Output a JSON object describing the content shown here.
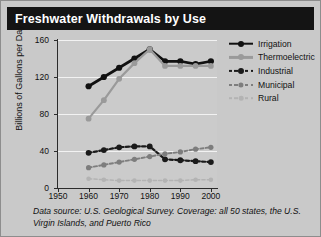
{
  "title": "Freshwater Withdrawals by Use",
  "caption": "Data source: U.S. Geological Survey. Coverage: all 50 states, the U.S. Virgin Islands, and Puerto Rico",
  "colors": {
    "background": "#c9c9c9",
    "title_bar": "#141414",
    "title_text": "#ffffff",
    "axis": "#2b2b2b",
    "gridline": "#f2f2f2",
    "irrigation": "#111111",
    "thermoelectric": "#9a9a9a",
    "industrial": "#1a1a1a",
    "municipal": "#7d7d7d",
    "rural": "#b3b3b3"
  },
  "legend": {
    "position": "right",
    "items": [
      {
        "label": "Irrigation",
        "color": "#111111",
        "dash": "solid",
        "width": 2.6
      },
      {
        "label": "Thermoelectric",
        "color": "#9a9a9a",
        "dash": "solid",
        "width": 2.2
      },
      {
        "label": "Industrial",
        "color": "#1a1a1a",
        "dash": "dashed",
        "width": 2.2
      },
      {
        "label": "Municipal",
        "color": "#7d7d7d",
        "dash": "dashed",
        "width": 2.0
      },
      {
        "label": "Rural",
        "color": "#b3b3b3",
        "dash": "dashed",
        "width": 1.6
      }
    ]
  },
  "chart_data": {
    "type": "line",
    "title": "Freshwater Withdrawals by Use",
    "xlabel": "",
    "ylabel": "Billions of Gallons per Day",
    "xlim": [
      1950,
      2002
    ],
    "ylim": [
      0,
      160
    ],
    "yticks": [
      0,
      40,
      80,
      120,
      160
    ],
    "xticks": [
      1950,
      1960,
      1970,
      1980,
      1990,
      2000
    ],
    "grid": "horizontal",
    "x": [
      1960,
      1965,
      1970,
      1975,
      1980,
      1985,
      1990,
      1995,
      2000
    ],
    "series": [
      {
        "name": "Irrigation",
        "color": "#111111",
        "dash": "solid",
        "values": [
          110,
          120,
          130,
          140,
          150,
          137,
          137,
          134,
          137
        ]
      },
      {
        "name": "Thermoelectric",
        "color": "#9a9a9a",
        "dash": "solid",
        "values": [
          75,
          95,
          118,
          135,
          150,
          132,
          132,
          132,
          132
        ]
      },
      {
        "name": "Industrial",
        "color": "#1a1a1a",
        "dash": "dashed",
        "values": [
          38,
          41,
          44,
          45,
          45,
          31,
          30,
          29,
          28
        ]
      },
      {
        "name": "Municipal",
        "color": "#7d7d7d",
        "dash": "dashed",
        "values": [
          22,
          25,
          28,
          31,
          34,
          37,
          39,
          42,
          44
        ]
      },
      {
        "name": "Rural",
        "color": "#b3b3b3",
        "dash": "dashed",
        "values": [
          10,
          9,
          8,
          8,
          8,
          8,
          8,
          9,
          9
        ]
      }
    ]
  }
}
